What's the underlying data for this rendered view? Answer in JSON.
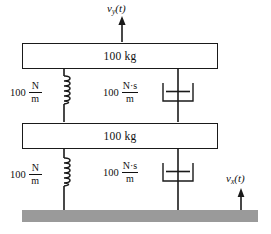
{
  "diagram": {
    "colors": {
      "line": "#1a1a1a",
      "ground": "#9a9a9a",
      "background": "#ffffff"
    },
    "masses": [
      {
        "id": "upper-mass",
        "label": "100 kg",
        "value": 100,
        "unit": "kg"
      },
      {
        "id": "lower-mass",
        "label": "100 kg",
        "value": 100,
        "unit": "kg"
      }
    ],
    "springs": [
      {
        "id": "upper-spring",
        "coefficient": "100",
        "numerator": "N",
        "denominator": "m",
        "value": 100,
        "unit": "N/m"
      },
      {
        "id": "lower-spring",
        "coefficient": "100",
        "numerator": "N",
        "denominator": "m",
        "value": 100,
        "unit": "N/m"
      }
    ],
    "dampers": [
      {
        "id": "upper-damper",
        "coefficient": "100",
        "numerator": "N·s",
        "denominator": "m",
        "value": 100,
        "unit": "N·s/m"
      },
      {
        "id": "lower-damper",
        "coefficient": "100",
        "numerator": "N·s",
        "denominator": "m",
        "value": 100,
        "unit": "N·s/m"
      }
    ],
    "velocities": [
      {
        "id": "output-velocity",
        "base": "v",
        "subscript": "y",
        "argument": "(t)",
        "label": "v_y(t)",
        "direction": "up"
      },
      {
        "id": "input-velocity",
        "base": "v",
        "subscript": "x",
        "argument": "(t)",
        "label": "v_x(t)",
        "direction": "up"
      }
    ],
    "ground": {
      "id": "ground-surface",
      "label": "ground"
    }
  }
}
